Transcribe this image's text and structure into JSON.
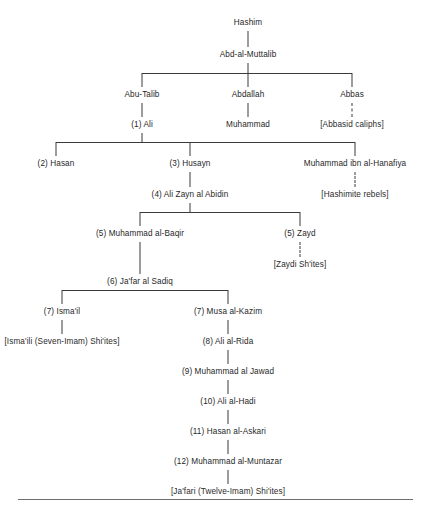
{
  "diagram": {
    "type": "family-tree",
    "line_color": "#3a3a3a",
    "text_color": "#1f1f1f",
    "background": "#ffffff",
    "legend": {
      "solid_line": "direct descent",
      "dashed_line": "leads to sect or dynasty"
    }
  },
  "nodes": [
    {
      "id": "hashim",
      "label": "Hashim",
      "x": 248,
      "y": 18,
      "kind": "person"
    },
    {
      "id": "abd_muttalib",
      "label": "Abd-al-Muttalib",
      "x": 248,
      "y": 50,
      "kind": "person"
    },
    {
      "id": "abu_talib",
      "label": "Abu-Talib",
      "x": 142,
      "y": 90,
      "kind": "person"
    },
    {
      "id": "abdallah",
      "label": "Abdallah",
      "x": 248,
      "y": 90,
      "kind": "person"
    },
    {
      "id": "abbas",
      "label": "Abbas",
      "x": 352,
      "y": 90,
      "kind": "person"
    },
    {
      "id": "ali_1",
      "label": "(1) Ali",
      "x": 142,
      "y": 120,
      "kind": "imam",
      "number": 1
    },
    {
      "id": "muhammad",
      "label": "Muhammad",
      "x": 248,
      "y": 120,
      "kind": "person"
    },
    {
      "id": "abbasid",
      "label": "[Abbasid caliphs]",
      "x": 352,
      "y": 120,
      "kind": "terminal"
    },
    {
      "id": "hasan_2",
      "label": "(2) Hasan",
      "x": 56,
      "y": 159,
      "kind": "imam",
      "number": 2
    },
    {
      "id": "husayn_3",
      "label": "(3) Husayn",
      "x": 190,
      "y": 159,
      "kind": "imam",
      "number": 3
    },
    {
      "id": "hanafiya",
      "label": "Muhammad ibn al-Hanafiya",
      "x": 355,
      "y": 159,
      "kind": "person"
    },
    {
      "id": "hashimite",
      "label": "[Hashimite rebels]",
      "x": 355,
      "y": 190,
      "kind": "terminal"
    },
    {
      "id": "abidin_4",
      "label": "(4) Ali Zayn al Abidin",
      "x": 190,
      "y": 190,
      "kind": "imam",
      "number": 4
    },
    {
      "id": "baqir_5",
      "label": "(5) Muhammad al-Baqir",
      "x": 140,
      "y": 229,
      "kind": "imam",
      "number": 5
    },
    {
      "id": "zayd_5",
      "label": "(5) Zayd",
      "x": 300,
      "y": 229,
      "kind": "imam",
      "number": 5
    },
    {
      "id": "zaydi",
      "label": "[Zaydi Sh'ites]",
      "x": 300,
      "y": 260,
      "kind": "terminal"
    },
    {
      "id": "sadiq_6",
      "label": "(6) Ja'far al Sadiq",
      "x": 140,
      "y": 277,
      "kind": "imam",
      "number": 6
    },
    {
      "id": "ismail_7",
      "label": "(7) Isma'il",
      "x": 62,
      "y": 307,
      "kind": "imam",
      "number": 7
    },
    {
      "id": "musa_7",
      "label": "(7) Musa al-Kazim",
      "x": 228,
      "y": 307,
      "kind": "imam",
      "number": 7
    },
    {
      "id": "ismaili",
      "label": "[Isma'ili (Seven-Imam) Shi'ites]",
      "x": 62,
      "y": 337,
      "kind": "terminal"
    },
    {
      "id": "rida_8",
      "label": "(8) Ali al-Rida",
      "x": 228,
      "y": 337,
      "kind": "imam",
      "number": 8
    },
    {
      "id": "jawad_9",
      "label": "(9) Muhammad al Jawad",
      "x": 228,
      "y": 367,
      "kind": "imam",
      "number": 9
    },
    {
      "id": "hadi_10",
      "label": "(10) Ali al-Hadi",
      "x": 228,
      "y": 397,
      "kind": "imam",
      "number": 10
    },
    {
      "id": "askari_11",
      "label": "(11) Hasan al-Askari",
      "x": 228,
      "y": 427,
      "kind": "imam",
      "number": 11
    },
    {
      "id": "muntazar_12",
      "label": "(12) Muhammad al-Muntazar",
      "x": 228,
      "y": 457,
      "kind": "imam",
      "number": 12
    },
    {
      "id": "jafari",
      "label": "[Ja'fari (Twelve-Imam) Shi'ites]",
      "x": 228,
      "y": 487,
      "kind": "terminal"
    }
  ],
  "edges": [
    {
      "from": "hashim",
      "to": "abd_muttalib",
      "style": "solid"
    },
    {
      "from": "abd_muttalib",
      "to": "abu_talib",
      "style": "solid"
    },
    {
      "from": "abd_muttalib",
      "to": "abdallah",
      "style": "solid"
    },
    {
      "from": "abd_muttalib",
      "to": "abbas",
      "style": "solid"
    },
    {
      "from": "abu_talib",
      "to": "ali_1",
      "style": "solid"
    },
    {
      "from": "abdallah",
      "to": "muhammad",
      "style": "solid"
    },
    {
      "from": "abbas",
      "to": "abbasid",
      "style": "dashed"
    },
    {
      "from": "ali_1",
      "to": "hasan_2",
      "style": "solid"
    },
    {
      "from": "ali_1",
      "to": "husayn_3",
      "style": "solid"
    },
    {
      "from": "ali_1",
      "to": "hanafiya",
      "style": "solid"
    },
    {
      "from": "hanafiya",
      "to": "hashimite",
      "style": "dashed"
    },
    {
      "from": "husayn_3",
      "to": "abidin_4",
      "style": "solid"
    },
    {
      "from": "abidin_4",
      "to": "baqir_5",
      "style": "solid"
    },
    {
      "from": "abidin_4",
      "to": "zayd_5",
      "style": "solid"
    },
    {
      "from": "zayd_5",
      "to": "zaydi",
      "style": "dashed"
    },
    {
      "from": "baqir_5",
      "to": "sadiq_6",
      "style": "solid"
    },
    {
      "from": "sadiq_6",
      "to": "ismail_7",
      "style": "solid"
    },
    {
      "from": "sadiq_6",
      "to": "musa_7",
      "style": "solid"
    },
    {
      "from": "ismail_7",
      "to": "ismaili",
      "style": "solid"
    },
    {
      "from": "musa_7",
      "to": "rida_8",
      "style": "solid"
    },
    {
      "from": "rida_8",
      "to": "jawad_9",
      "style": "solid"
    },
    {
      "from": "jawad_9",
      "to": "hadi_10",
      "style": "solid"
    },
    {
      "from": "hadi_10",
      "to": "askari_11",
      "style": "solid"
    },
    {
      "from": "askari_11",
      "to": "muntazar_12",
      "style": "solid"
    },
    {
      "from": "muntazar_12",
      "to": "jafari",
      "style": "solid"
    }
  ],
  "footer": {
    "rule_y": 499,
    "rule_x": 18,
    "rule_width": 395,
    "caption_cut_off": ""
  }
}
